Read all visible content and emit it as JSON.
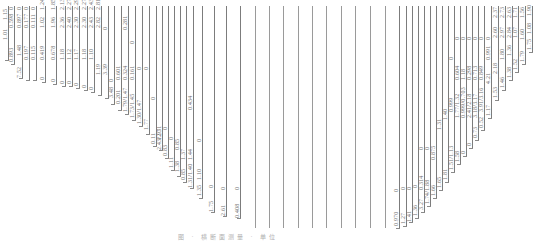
{
  "figure": {
    "type": "cross-section-profile",
    "caption": "图 · 横断面测量 · 单位",
    "line_color": "#9a9a9a",
    "text_color": "#707070",
    "columns": [
      {
        "x": 8,
        "top": 6,
        "bottom": 60,
        "labels": [
          {
            "t": "1.01",
            "y": 40
          },
          {
            "t": "1.15",
            "y": 20
          }
        ]
      },
      {
        "x": 14,
        "top": 6,
        "bottom": 64,
        "labels": [
          {
            "t": "0.893",
            "y": 62
          },
          {
            "t": "0.598",
            "y": 28
          },
          {
            "t": "0",
            "y": 10
          }
        ]
      },
      {
        "x": 22,
        "top": 6,
        "bottom": 78,
        "labels": [
          {
            "t": "7.52",
            "y": 78
          },
          {
            "t": "1.48",
            "y": 56
          },
          {
            "t": "0.897",
            "y": 28
          },
          {
            "t": "0",
            "y": 10
          }
        ]
      },
      {
        "x": 29,
        "top": 6,
        "bottom": 80,
        "labels": [
          {
            "t": "0.197",
            "y": 60
          },
          {
            "t": "0.177",
            "y": 28
          },
          {
            "t": "0",
            "y": 10
          }
        ]
      },
      {
        "x": 36,
        "top": 6,
        "bottom": 80,
        "labels": [
          {
            "t": "0.115",
            "y": 60
          },
          {
            "t": "0.111",
            "y": 28
          },
          {
            "t": "0",
            "y": 10
          }
        ]
      },
      {
        "x": 45,
        "top": 6,
        "bottom": 82,
        "labels": [
          {
            "t": "0",
            "y": 80
          },
          {
            "t": "0.419",
            "y": 60
          },
          {
            "t": "1.02",
            "y": 28
          },
          {
            "t": "1.24",
            "y": 10
          }
        ]
      },
      {
        "x": 56,
        "top": 6,
        "bottom": 84,
        "labels": [
          {
            "t": "0",
            "y": 82
          },
          {
            "t": "0.678",
            "y": 60
          },
          {
            "t": "1.96",
            "y": 28
          },
          {
            "t": "1.85",
            "y": 10
          }
        ]
      },
      {
        "x": 65,
        "top": 6,
        "bottom": 86,
        "labels": [
          {
            "t": "0",
            "y": 84
          },
          {
            "t": "1.18",
            "y": 60
          },
          {
            "t": "2.36",
            "y": 28
          },
          {
            "t": "2.13",
            "y": 10
          }
        ]
      },
      {
        "x": 72,
        "top": 6,
        "bottom": 86,
        "labels": [
          {
            "t": "0",
            "y": 84
          },
          {
            "t": "1.12",
            "y": 60
          },
          {
            "t": "2.40",
            "y": 28
          },
          {
            "t": "2.27",
            "y": 10
          }
        ]
      },
      {
        "x": 79,
        "top": 6,
        "bottom": 88,
        "labels": [
          {
            "t": "0",
            "y": 86
          },
          {
            "t": "1.17",
            "y": 60
          },
          {
            "t": "2.30",
            "y": 28
          },
          {
            "t": "2.29",
            "y": 10
          }
        ]
      },
      {
        "x": 87,
        "top": 6,
        "bottom": 90,
        "labels": [
          {
            "t": "0",
            "y": 88
          },
          {
            "t": "1.18",
            "y": 60
          },
          {
            "t": "2.30",
            "y": 28
          },
          {
            "t": "2.27",
            "y": 10
          }
        ]
      },
      {
        "x": 94,
        "top": 6,
        "bottom": 92,
        "labels": [
          {
            "t": "0",
            "y": 90
          },
          {
            "t": "1.10",
            "y": 60
          },
          {
            "t": "2.43",
            "y": 28
          },
          {
            "t": "2.43",
            "y": 10
          }
        ]
      },
      {
        "x": 101,
        "top": 6,
        "bottom": 95,
        "labels": [
          {
            "t": "1.19",
            "y": 75
          },
          {
            "t": "2.82",
            "y": 28
          },
          {
            "t": "2.81",
            "y": 10
          }
        ]
      },
      {
        "x": 108,
        "top": 6,
        "bottom": 98,
        "labels": [
          {
            "t": "3.39",
            "y": 75
          },
          {
            "t": "0",
            "y": 30
          }
        ]
      },
      {
        "x": 114,
        "top": 6,
        "bottom": 104,
        "labels": [
          {
            "t": "3.48",
            "y": 98
          },
          {
            "t": "0",
            "y": 82
          }
        ]
      },
      {
        "x": 121,
        "top": 6,
        "bottom": 110,
        "labels": [
          {
            "t": "0.201",
            "y": 104
          },
          {
            "t": "0.601",
            "y": 80
          }
        ]
      },
      {
        "x": 128,
        "top": 6,
        "bottom": 114,
        "labels": [
          {
            "t": "1.79/1.47",
            "y": 112
          },
          {
            "t": "0.324",
            "y": 80
          },
          {
            "t": "0.281",
            "y": 30
          }
        ]
      },
      {
        "x": 135,
        "top": 6,
        "bottom": 120,
        "labels": [
          {
            "t": "1.73/1.45",
            "y": 118
          },
          {
            "t": "0.161",
            "y": 80
          },
          {
            "t": "0",
            "y": 44
          }
        ]
      },
      {
        "x": 142,
        "top": 6,
        "bottom": 126,
        "labels": [
          {
            "t": "1.30/1.47",
            "y": 124
          },
          {
            "t": "0",
            "y": 70
          }
        ]
      },
      {
        "x": 149,
        "top": 6,
        "bottom": 134,
        "labels": [
          {
            "t": "1.77",
            "y": 130
          },
          {
            "t": "0",
            "y": 70
          }
        ]
      },
      {
        "x": 156,
        "top": 6,
        "bottom": 146,
        "labels": [
          {
            "t": "0.11",
            "y": 144
          },
          {
            "t": "0",
            "y": 100
          }
        ]
      },
      {
        "x": 162,
        "top": 6,
        "bottom": 150,
        "labels": [
          {
            "t": "2.43/2.31",
            "y": 150
          },
          {
            "t": "1.97",
            "y": 140
          }
        ]
      },
      {
        "x": 168,
        "top": 6,
        "bottom": 158,
        "labels": [
          {
            "t": "0.83",
            "y": 156
          },
          {
            "t": "0",
            "y": 130
          }
        ]
      },
      {
        "x": 174,
        "top": 6,
        "bottom": 170,
        "labels": [
          {
            "t": "1.11",
            "y": 168
          },
          {
            "t": "0",
            "y": 140
          }
        ]
      },
      {
        "x": 180,
        "top": 6,
        "bottom": 176,
        "labels": [
          {
            "t": "1.38",
            "y": 172
          },
          {
            "t": "0.85",
            "y": 150
          }
        ]
      },
      {
        "x": 186,
        "top": 6,
        "bottom": 182,
        "labels": [
          {
            "t": "0.85",
            "y": 180
          },
          {
            "t": "1.37",
            "y": 160
          }
        ]
      },
      {
        "x": 193,
        "top": 6,
        "bottom": 188,
        "labels": [
          {
            "t": "1.31/1.40",
            "y": 188
          },
          {
            "t": "1.44",
            "y": 160
          },
          {
            "t": "0.434",
            "y": 110
          }
        ]
      },
      {
        "x": 202,
        "top": 6,
        "bottom": 198,
        "labels": [
          {
            "t": "1.35",
            "y": 196
          },
          {
            "t": "1.10",
            "y": 180
          },
          {
            "t": "0",
            "y": 142
          }
        ]
      },
      {
        "x": 214,
        "top": 6,
        "bottom": 212,
        "labels": [
          {
            "t": "1.75",
            "y": 212
          },
          {
            "t": "0",
            "y": 188
          }
        ]
      },
      {
        "x": 226,
        "top": 6,
        "bottom": 216,
        "labels": [
          {
            "t": "2.61",
            "y": 216
          },
          {
            "t": "0",
            "y": 190
          }
        ]
      },
      {
        "x": 240,
        "top": 6,
        "bottom": 218,
        "labels": [
          {
            "t": "0.408",
            "y": 218
          },
          {
            "t": "0",
            "y": 190
          }
        ]
      },
      {
        "x": 255,
        "top": 6,
        "bottom": 228,
        "labels": []
      },
      {
        "x": 269,
        "top": 6,
        "bottom": 228,
        "labels": []
      },
      {
        "x": 283,
        "top": 6,
        "bottom": 228,
        "labels": []
      },
      {
        "x": 298,
        "top": 6,
        "bottom": 228,
        "labels": []
      },
      {
        "x": 312,
        "top": 6,
        "bottom": 228,
        "labels": []
      },
      {
        "x": 326,
        "top": 6,
        "bottom": 228,
        "labels": []
      },
      {
        "x": 341,
        "top": 6,
        "bottom": 228,
        "labels": []
      },
      {
        "x": 355,
        "top": 6,
        "bottom": 228,
        "labels": []
      },
      {
        "x": 370,
        "top": 6,
        "bottom": 228,
        "labels": []
      },
      {
        "x": 385,
        "top": 6,
        "bottom": 228,
        "labels": []
      },
      {
        "x": 399,
        "top": 6,
        "bottom": 228,
        "labels": [
          {
            "t": "0.970",
            "y": 226
          },
          {
            "t": "0",
            "y": 192
          }
        ]
      },
      {
        "x": 406,
        "top": 6,
        "bottom": 226,
        "labels": [
          {
            "t": "1.27",
            "y": 224
          },
          {
            "t": "0",
            "y": 190
          }
        ]
      },
      {
        "x": 412,
        "top": 6,
        "bottom": 222,
        "labels": [
          {
            "t": "1.41",
            "y": 222
          },
          {
            "t": "0",
            "y": 190
          }
        ]
      },
      {
        "x": 418,
        "top": 6,
        "bottom": 218,
        "labels": [
          {
            "t": "1.36",
            "y": 216
          },
          {
            "t": "0",
            "y": 188
          }
        ]
      },
      {
        "x": 424,
        "top": 6,
        "bottom": 212,
        "labels": [
          {
            "t": "3.27",
            "y": 210
          },
          {
            "t": "0.314",
            "y": 190
          },
          {
            "t": "0",
            "y": 150
          }
        ]
      },
      {
        "x": 430,
        "top": 6,
        "bottom": 206,
        "labels": [
          {
            "t": "1.74/1.88",
            "y": 204
          },
          {
            "t": "0",
            "y": 150
          }
        ]
      },
      {
        "x": 436,
        "top": 6,
        "bottom": 198,
        "labels": [
          {
            "t": "1.66",
            "y": 196
          },
          {
            "t": "0.875",
            "y": 160
          }
        ]
      },
      {
        "x": 442,
        "top": 6,
        "bottom": 190,
        "labels": [
          {
            "t": "1.65",
            "y": 188
          },
          {
            "t": "1.31",
            "y": 130
          }
        ]
      },
      {
        "x": 448,
        "top": 6,
        "bottom": 182,
        "labels": [
          {
            "t": "1.81",
            "y": 180
          },
          {
            "t": "1.40",
            "y": 120
          }
        ]
      },
      {
        "x": 454,
        "top": 6,
        "bottom": 172,
        "labels": [
          {
            "t": "1.51/1.13",
            "y": 170
          },
          {
            "t": "0.999",
            "y": 112
          },
          {
            "t": "0",
            "y": 60
          }
        ]
      },
      {
        "x": 460,
        "top": 6,
        "bottom": 164,
        "labels": [
          {
            "t": "1.58",
            "y": 162
          },
          {
            "t": "1.77/1.32",
            "y": 118
          },
          {
            "t": "0.604",
            "y": 80
          },
          {
            "t": "0",
            "y": 40
          }
        ]
      },
      {
        "x": 466,
        "top": 6,
        "bottom": 156,
        "labels": [
          {
            "t": "0",
            "y": 154
          },
          {
            "t": "0.999/0.703",
            "y": 118
          },
          {
            "t": "1.18",
            "y": 80
          },
          {
            "t": "0",
            "y": 40
          }
        ]
      },
      {
        "x": 472,
        "top": 6,
        "bottom": 148,
        "labels": [
          {
            "t": "0",
            "y": 146
          },
          {
            "t": "2.41/2.18",
            "y": 118
          },
          {
            "t": "0.298",
            "y": 80
          },
          {
            "t": "0",
            "y": 40
          }
        ]
      },
      {
        "x": 478,
        "top": 6,
        "bottom": 140,
        "labels": [
          {
            "t": "0.73",
            "y": 138
          },
          {
            "t": "3.18/3.17",
            "y": 118
          },
          {
            "t": "0.713",
            "y": 80
          },
          {
            "t": "0",
            "y": 40
          }
        ]
      },
      {
        "x": 484,
        "top": 6,
        "bottom": 130,
        "labels": [
          {
            "t": "0.52",
            "y": 128
          },
          {
            "t": "3.91/3.16",
            "y": 112
          },
          {
            "t": "0.849",
            "y": 80
          },
          {
            "t": "0",
            "y": 40
          }
        ]
      },
      {
        "x": 491,
        "top": 6,
        "bottom": 118,
        "labels": [
          {
            "t": "1.17",
            "y": 116
          },
          {
            "t": "4.21",
            "y": 84
          },
          {
            "t": "0.991",
            "y": 60
          },
          {
            "t": "0",
            "y": 40
          }
        ]
      },
      {
        "x": 498,
        "top": 6,
        "bottom": 100,
        "labels": [
          {
            "t": "1.53",
            "y": 98
          },
          {
            "t": "2.18",
            "y": 74
          },
          {
            "t": "2.60",
            "y": 38
          },
          {
            "t": "2.37",
            "y": 18
          }
        ]
      },
      {
        "x": 505,
        "top": 6,
        "bottom": 90,
        "labels": [
          {
            "t": "1.46",
            "y": 88
          },
          {
            "t": "1.80",
            "y": 60
          },
          {
            "t": "2.97",
            "y": 38
          },
          {
            "t": "2.73",
            "y": 18
          }
        ]
      },
      {
        "x": 512,
        "top": 6,
        "bottom": 80,
        "labels": [
          {
            "t": "1.38",
            "y": 78
          },
          {
            "t": "1.36",
            "y": 56
          },
          {
            "t": "2.84",
            "y": 38
          },
          {
            "t": "2.63",
            "y": 18
          }
        ]
      },
      {
        "x": 518,
        "top": 6,
        "bottom": 72,
        "labels": [
          {
            "t": "1.52",
            "y": 70
          },
          {
            "t": "1.07",
            "y": 38
          },
          {
            "t": "1.71",
            "y": 18
          }
        ]
      },
      {
        "x": 525,
        "top": 6,
        "bottom": 64,
        "labels": [
          {
            "t": "1.79",
            "y": 62
          },
          {
            "t": "1.60",
            "y": 40
          },
          {
            "t": "1.56",
            "y": 18
          }
        ]
      },
      {
        "x": 532,
        "top": 6,
        "bottom": 52,
        "labels": [
          {
            "t": "1.75",
            "y": 50
          },
          {
            "t": "1.08",
            "y": 34
          },
          {
            "t": "1.90",
            "y": 16
          }
        ]
      }
    ]
  }
}
